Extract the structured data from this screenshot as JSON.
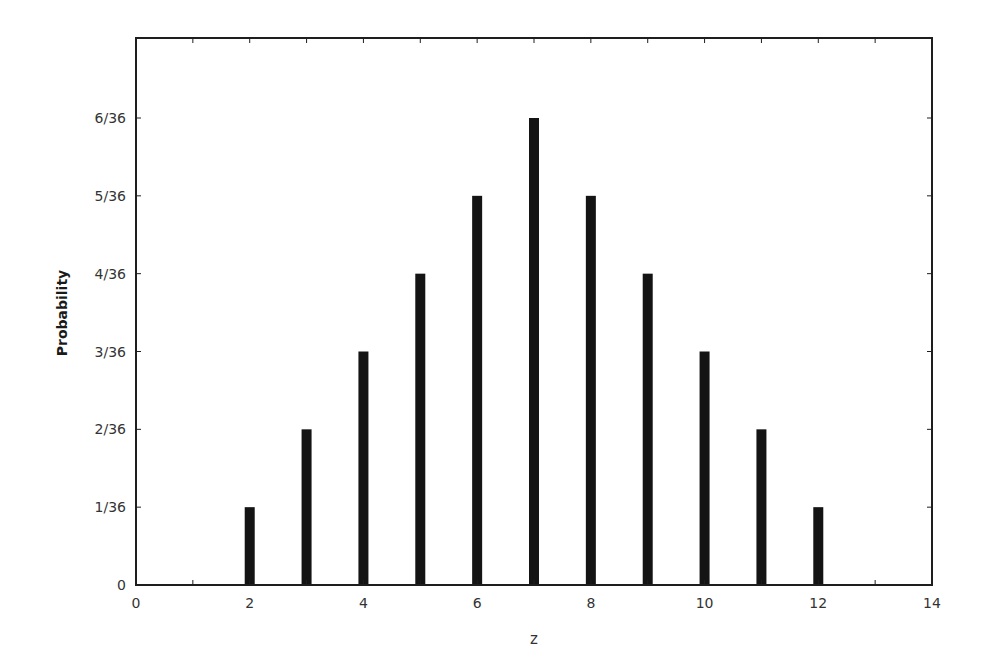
{
  "chart_data": {
    "type": "bar",
    "title": "",
    "xlabel": "z",
    "ylabel": "Probability",
    "x": [
      2,
      3,
      4,
      5,
      6,
      7,
      8,
      9,
      10,
      11,
      12
    ],
    "values": [
      0.027778,
      0.055556,
      0.083333,
      0.111111,
      0.138889,
      0.166667,
      0.138889,
      0.111111,
      0.083333,
      0.055556,
      0.027778
    ],
    "values_fraction": [
      "1/36",
      "2/36",
      "3/36",
      "4/36",
      "5/36",
      "6/36",
      "5/36",
      "4/36",
      "3/36",
      "2/36",
      "1/36"
    ],
    "numerators_over_36": [
      1,
      2,
      3,
      4,
      5,
      6,
      5,
      4,
      3,
      2,
      1
    ],
    "xlim": [
      0,
      14
    ],
    "ylim": [
      0,
      0.194444
    ],
    "x_ticks": [
      0,
      2,
      4,
      6,
      8,
      10,
      12,
      14
    ],
    "x_tick_labels": [
      "0",
      "2",
      "4",
      "6",
      "8",
      "10",
      "12",
      "14"
    ],
    "x_minor_ticks": [
      1,
      3,
      5,
      7,
      9,
      11,
      13
    ],
    "y_ticks": [
      0,
      1,
      2,
      3,
      4,
      5,
      6
    ],
    "y_tick_labels": [
      "0",
      "1/36",
      "2/36",
      "3/36",
      "4/36",
      "5/36",
      "6/36"
    ],
    "grid": false,
    "legend": null,
    "bar_color": "#141414",
    "frame_color": "#1e1e1e"
  }
}
